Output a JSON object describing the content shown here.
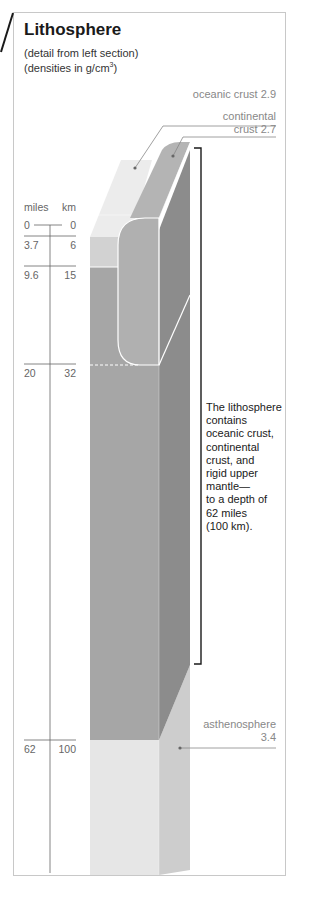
{
  "header": {
    "title": "Lithosphere",
    "subtitle_line1": "(detail from left section)",
    "subtitle_line2_prefix": "(densities in g/cm",
    "subtitle_line2_sup": "3",
    "subtitle_line2_suffix": ")"
  },
  "labels": {
    "oceanic_crust": "oceanic crust 2.9",
    "continental_line1": "continental",
    "continental_line2": "crust 2.7",
    "asthenosphere_line1": "asthenosphere",
    "asthenosphere_line2": "3.4"
  },
  "scale": {
    "unit_left": "miles",
    "unit_right": "km",
    "ticks": [
      {
        "miles": "0",
        "km": "0"
      },
      {
        "miles": "3.7",
        "km": "6"
      },
      {
        "miles": "9.6",
        "km": "15"
      },
      {
        "miles": "20",
        "km": "32"
      },
      {
        "miles": "62",
        "km": "100"
      }
    ]
  },
  "note": {
    "lines": [
      "The lithosphere",
      "contains",
      "oceanic crust,",
      "continental",
      "crust, and",
      "rigid upper",
      "mantle—",
      "to a depth of",
      "62 miles",
      "(100 km)."
    ]
  },
  "colors": {
    "oceanic_top": "#ececec",
    "oceanic_front": "#d2d2d2",
    "continental_top": "#b4b4b4",
    "continental_front": "#a8a8a8",
    "mantle_front": "#a6a6a6",
    "mantle_side": "#8c8c8c",
    "astheno_front": "#e6e6e6",
    "astheno_side": "#cdcdcd",
    "bracket": "#1a1a1a",
    "leader": "#888888"
  }
}
